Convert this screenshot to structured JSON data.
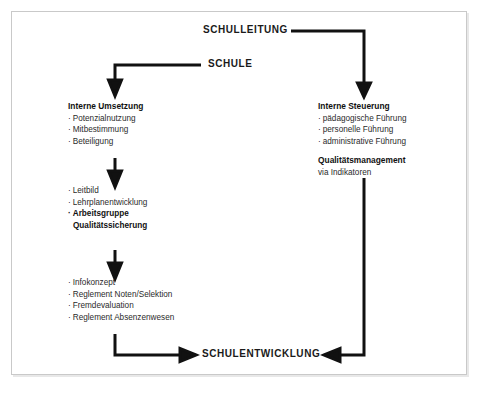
{
  "diagram": {
    "title_nodes": {
      "schulleitung": "SCHULLEITUNG",
      "schule": "SCHULE",
      "schulentwicklung": "SCHULENTWICKLUNG"
    },
    "left_column": {
      "block1": {
        "heading": "Interne Umsetzung",
        "items": [
          "Potenzialnutzung",
          "Mitbestimmung",
          "Beteiligung"
        ]
      },
      "block2": {
        "items": [
          "Leitbild",
          "Lehrplanentwicklung"
        ],
        "bold_item_line1": "Arbeitsgruppe",
        "bold_item_line2": "Qualitätssicherung"
      },
      "block3": {
        "items": [
          "Infokonzept",
          "Reglement Noten/Selektion",
          "Fremdevaluation",
          "Reglement Absenzenwesen"
        ]
      }
    },
    "right_column": {
      "block1": {
        "heading": "Interne Steuerung",
        "items": [
          "pädagogische Führung",
          "personelle Führung",
          "administrative Führung"
        ]
      },
      "block2": {
        "heading": "Qualitätsmanagement",
        "subtitle": "via Indikatoren"
      }
    },
    "bullet_glyph": "·",
    "colors": {
      "wire": "#111111",
      "frame": "#c9c9c9",
      "text": "#1a1a1a",
      "background": "#ffffff"
    }
  }
}
